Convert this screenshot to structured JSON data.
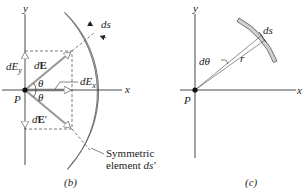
{
  "panels": [
    {
      "id": "b",
      "caption": "(b)",
      "axes": {
        "x_label": "x",
        "y_label": "y",
        "origin_label": "P"
      },
      "vectors": [
        {
          "name": "dE",
          "label_prefix": "d",
          "label_bold": "E",
          "label_suffix": ""
        },
        {
          "name": "dE_prime",
          "label_prefix": "d",
          "label_bold": "E",
          "label_suffix": "′"
        },
        {
          "name": "dE_x",
          "label_prefix": "dE",
          "label_sub": "x"
        },
        {
          "name": "dE_y",
          "label_prefix": "dE",
          "label_sub": "y"
        }
      ],
      "angles": [
        "θ",
        "θ"
      ],
      "element_label": "ds",
      "annotation_line1": "Symmetric",
      "annotation_line2_text": "element ",
      "annotation_line2_italic": "ds′"
    },
    {
      "id": "c",
      "caption": "(c)",
      "axes": {
        "x_label": "x",
        "y_label": "y",
        "origin_label": "P"
      },
      "angle_label": "dθ",
      "radius_label": "r",
      "element_label": "ds"
    }
  ],
  "colors": {
    "arc_fill": "#cfcfcf",
    "arc_stroke": "#555555",
    "axis": "#333333",
    "vector": "#9a9a9a",
    "dashed": "#444444",
    "text": "#222222"
  }
}
